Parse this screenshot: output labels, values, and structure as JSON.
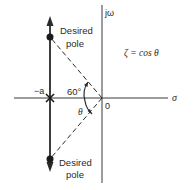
{
  "diagram": {
    "type": "s-plane root locus",
    "axes": {
      "imag_label": "jω",
      "real_label": "σ",
      "origin_label": "0"
    },
    "open_loop_pole_label": "−a",
    "angle_label": "60°",
    "theta_label": "θ",
    "equation": "ζ = cos θ",
    "poles": [
      {
        "label_line1": "Desired",
        "label_line2": "pole",
        "position": "upper"
      },
      {
        "label_line1": "Desired",
        "label_line2": "pole",
        "position": "lower"
      }
    ],
    "colors": {
      "line": "#2a2a2a",
      "background": "#ffffff"
    }
  }
}
